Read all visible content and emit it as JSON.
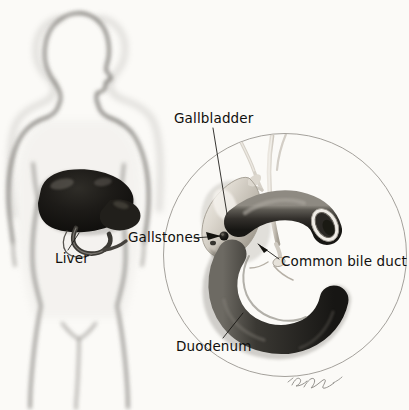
{
  "figure": {
    "background_color": "#fbfaf7",
    "ink_color": "#100f0d",
    "width": 409,
    "height": 410
  },
  "labels": {
    "gallbladder": "Gallbladder",
    "gallstones": "Gallstones",
    "common_bile_duct": "Common bile duct",
    "duodenum": "Duodenum",
    "liver": "Liver"
  },
  "body_figure": {
    "name": "human-torso-silhouette",
    "description": "Airbrushed grey outline of a human head, torso, arms and upper legs, head in three-quarter profile facing right",
    "outline_color": "#6f6c68"
  },
  "organs": {
    "liver": {
      "name": "liver",
      "shade": "#1a1916",
      "location": "upper right abdomen of silhouette"
    },
    "gallbladder": {
      "name": "gallbladder",
      "shade": "#d9d5cd",
      "location": "beneath liver, inside magnified circle at upper left"
    },
    "duodenum": {
      "name": "duodenum",
      "shade": "#3a3833",
      "shape": "C-shaped loop with cut-open end",
      "location": "center of magnified circle"
    },
    "common_bile_duct": {
      "name": "common-bile-duct",
      "shade": "#cfcac1",
      "location": "thin tube descending from hepatic ducts to duodenum"
    },
    "gallstones": {
      "name": "gallstones",
      "shade": "#141310",
      "location": "dark round stone in the neck of the gallbladder"
    }
  },
  "inset": {
    "name": "magnified-circle",
    "center_x": 285,
    "center_y": 255,
    "radius": 122,
    "stroke_color": "#9a9691"
  },
  "signature": {
    "name": "artist-signature",
    "style": "cursive-handwriting",
    "x": 295,
    "y": 382
  }
}
